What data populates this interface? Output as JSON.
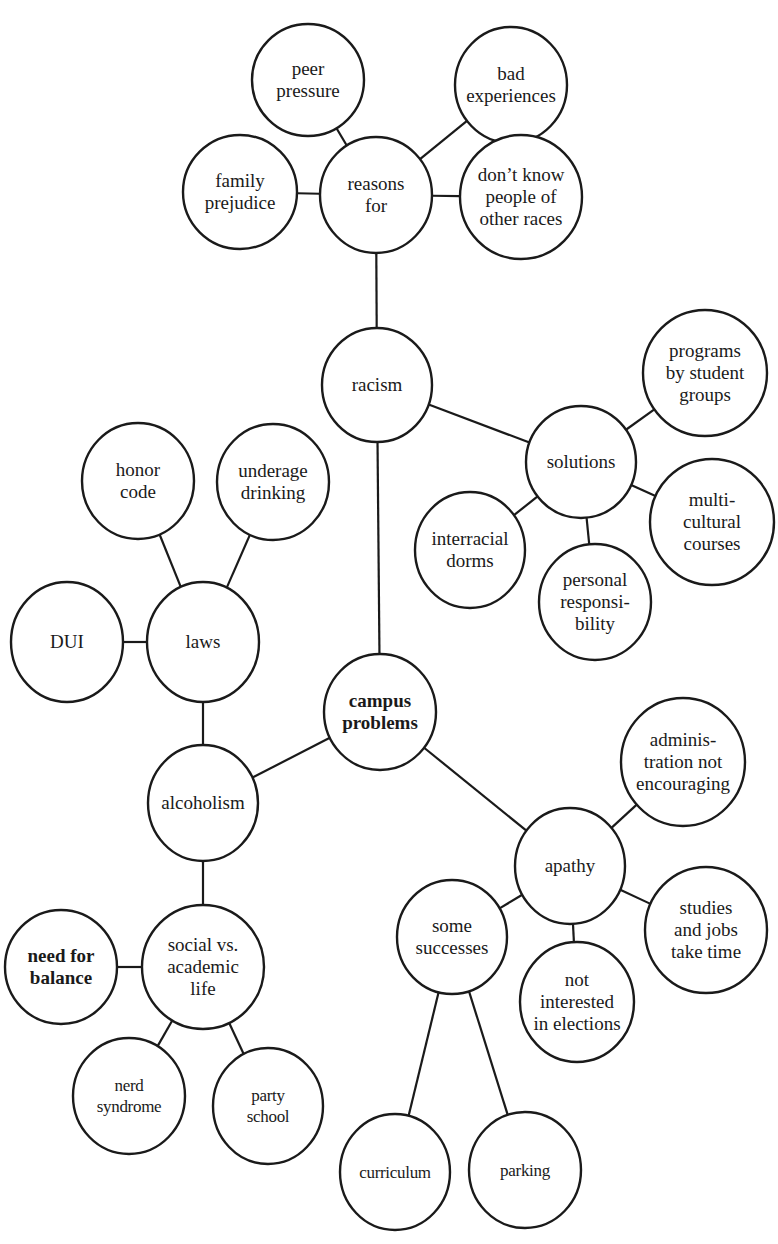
{
  "diagram": {
    "type": "cluster map",
    "central_topic": "campus problems",
    "nodes": [
      {
        "id": "peer_pressure",
        "lines": [
          "peer",
          "pressure"
        ],
        "cx": 308,
        "cy": 80,
        "rx": 56,
        "ry": 56
      },
      {
        "id": "bad_experiences",
        "lines": [
          "bad",
          "experiences"
        ],
        "cx": 511,
        "cy": 85,
        "rx": 56,
        "ry": 58
      },
      {
        "id": "family_prejudice",
        "lines": [
          "family",
          "prejudice"
        ],
        "cx": 240,
        "cy": 192,
        "rx": 57,
        "ry": 57
      },
      {
        "id": "reasons_for",
        "lines": [
          "reasons",
          "for"
        ],
        "cx": 376,
        "cy": 195,
        "rx": 56,
        "ry": 58
      },
      {
        "id": "dont_know",
        "lines": [
          "don’t know",
          "people of",
          "other races"
        ],
        "cx": 521,
        "cy": 197,
        "rx": 61,
        "ry": 62
      },
      {
        "id": "racism",
        "lines": [
          "racism"
        ],
        "cx": 377,
        "cy": 385,
        "rx": 55,
        "ry": 57
      },
      {
        "id": "programs",
        "lines": [
          "programs",
          "by student",
          "groups"
        ],
        "cx": 705,
        "cy": 373,
        "rx": 62,
        "ry": 63
      },
      {
        "id": "solutions",
        "lines": [
          "solutions"
        ],
        "cx": 581,
        "cy": 462,
        "rx": 55,
        "ry": 56
      },
      {
        "id": "interracial_dorms",
        "lines": [
          "interracial",
          "dorms"
        ],
        "cx": 470,
        "cy": 550,
        "rx": 55,
        "ry": 58
      },
      {
        "id": "multicultural",
        "lines": [
          "multi-",
          "cultural",
          "courses"
        ],
        "cx": 712,
        "cy": 522,
        "rx": 62,
        "ry": 63
      },
      {
        "id": "personal_responsibility",
        "lines": [
          "personal",
          "responsi-",
          "bility"
        ],
        "cx": 595,
        "cy": 602,
        "rx": 56,
        "ry": 58
      },
      {
        "id": "honor_code",
        "lines": [
          "honor",
          "code"
        ],
        "cx": 138,
        "cy": 481,
        "rx": 56,
        "ry": 58
      },
      {
        "id": "underage_drinking",
        "lines": [
          "underage",
          "drinking"
        ],
        "cx": 273,
        "cy": 482,
        "rx": 56,
        "ry": 58
      },
      {
        "id": "dui",
        "lines": [
          "DUI"
        ],
        "cx": 67,
        "cy": 642,
        "rx": 56,
        "ry": 60
      },
      {
        "id": "laws",
        "lines": [
          "laws"
        ],
        "cx": 203,
        "cy": 642,
        "rx": 56,
        "ry": 60
      },
      {
        "id": "campus_problems",
        "lines": [
          "campus",
          "problems"
        ],
        "cx": 380,
        "cy": 712,
        "rx": 56,
        "ry": 58,
        "bold": true
      },
      {
        "id": "alcoholism",
        "lines": [
          "alcoholism"
        ],
        "cx": 203,
        "cy": 803,
        "rx": 55,
        "ry": 58
      },
      {
        "id": "administration",
        "lines": [
          "adminis-",
          "tration not",
          "encouraging"
        ],
        "cx": 683,
        "cy": 762,
        "rx": 62,
        "ry": 64
      },
      {
        "id": "apathy",
        "lines": [
          "apathy"
        ],
        "cx": 570,
        "cy": 866,
        "rx": 55,
        "ry": 58
      },
      {
        "id": "some_successes",
        "lines": [
          "some",
          "successes"
        ],
        "cx": 452,
        "cy": 937,
        "rx": 55,
        "ry": 57
      },
      {
        "id": "studies_jobs",
        "lines": [
          "studies",
          "and jobs",
          "take time"
        ],
        "cx": 706,
        "cy": 930,
        "rx": 61,
        "ry": 63
      },
      {
        "id": "not_interested",
        "lines": [
          "not",
          "interested",
          "in elections"
        ],
        "cx": 577,
        "cy": 1002,
        "rx": 57,
        "ry": 60
      },
      {
        "id": "social_academic",
        "lines": [
          "social vs.",
          "academic",
          "life"
        ],
        "cx": 203,
        "cy": 967,
        "rx": 61,
        "ry": 62
      },
      {
        "id": "need_for_balance",
        "lines": [
          "need for",
          "balance"
        ],
        "cx": 61,
        "cy": 967,
        "rx": 56,
        "ry": 57,
        "bold": true
      },
      {
        "id": "nerd_syndrome",
        "lines": [
          "nerd",
          "syndrome"
        ],
        "cx": 129,
        "cy": 1096,
        "rx": 56,
        "ry": 58,
        "small": true
      },
      {
        "id": "party_school",
        "lines": [
          "party",
          "school"
        ],
        "cx": 268,
        "cy": 1106,
        "rx": 55,
        "ry": 58,
        "small": true
      },
      {
        "id": "curriculum",
        "lines": [
          "curriculum"
        ],
        "cx": 395,
        "cy": 1172,
        "rx": 55,
        "ry": 58,
        "small": true
      },
      {
        "id": "parking",
        "lines": [
          "parking"
        ],
        "cx": 525,
        "cy": 1170,
        "rx": 56,
        "ry": 58,
        "small": true
      }
    ],
    "edges": [
      [
        "reasons_for",
        "peer_pressure"
      ],
      [
        "reasons_for",
        "bad_experiences"
      ],
      [
        "reasons_for",
        "family_prejudice"
      ],
      [
        "reasons_for",
        "dont_know"
      ],
      [
        "racism",
        "reasons_for"
      ],
      [
        "racism",
        "solutions"
      ],
      [
        "solutions",
        "programs"
      ],
      [
        "solutions",
        "multicultural"
      ],
      [
        "solutions",
        "interracial_dorms"
      ],
      [
        "solutions",
        "personal_responsibility"
      ],
      [
        "campus_problems",
        "racism"
      ],
      [
        "laws",
        "honor_code"
      ],
      [
        "laws",
        "underage_drinking"
      ],
      [
        "laws",
        "dui"
      ],
      [
        "alcoholism",
        "laws"
      ],
      [
        "campus_problems",
        "alcoholism"
      ],
      [
        "campus_problems",
        "apathy"
      ],
      [
        "apathy",
        "administration"
      ],
      [
        "apathy",
        "studies_jobs"
      ],
      [
        "apathy",
        "not_interested"
      ],
      [
        "apathy",
        "some_successes"
      ],
      [
        "some_successes",
        "curriculum"
      ],
      [
        "some_successes",
        "parking"
      ],
      [
        "alcoholism",
        "social_academic"
      ],
      [
        "social_academic",
        "need_for_balance"
      ],
      [
        "social_academic",
        "nerd_syndrome"
      ],
      [
        "social_academic",
        "party_school"
      ]
    ],
    "stroke_color": "#1a1a1a",
    "fill_color": "#ffffff"
  }
}
